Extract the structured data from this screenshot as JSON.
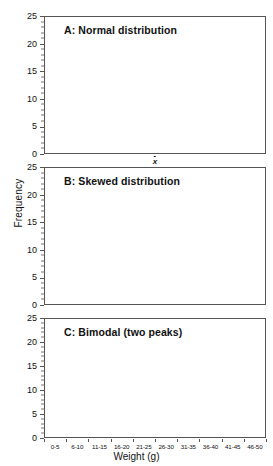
{
  "figure": {
    "xlabel": "Weight (g)",
    "ylabel": "Frequency",
    "bin_labels": [
      "0-5",
      "6-10",
      "11-15",
      "16-20",
      "21-25",
      "26-30",
      "31-35",
      "36-40",
      "41-45",
      "46-50"
    ],
    "y_ticks": [
      0,
      5,
      10,
      15,
      20,
      25
    ],
    "bar_color": "#1a1a1a",
    "curve_color": "#b3b3b3",
    "grid_color": "#d9d9d9",
    "mean_marker_label": "x"
  },
  "chart_data": [
    {
      "type": "bar",
      "panel": "A",
      "title": "A: Normal distribution",
      "categories": [
        "0-5",
        "6-10",
        "11-15",
        "16-20",
        "21-25",
        "26-30",
        "31-35",
        "36-40",
        "41-45",
        "46-50"
      ],
      "values": [
        2,
        3,
        10,
        13,
        19,
        20,
        16,
        12,
        3,
        2
      ],
      "xlabel": "",
      "ylabel": "Frequency",
      "ylim": [
        0,
        25
      ],
      "y_ticks": [
        0,
        5,
        10,
        15,
        20,
        25
      ],
      "grid": true,
      "legend": "none",
      "overlay": {
        "type": "line",
        "name": "normal curve",
        "color": "#b3b3b3",
        "peak_value": 20.5,
        "peak_category_index": 5
      },
      "annotations": [
        {
          "type": "vline",
          "label": "x",
          "style": "dotted",
          "color": "#ffffff",
          "at_category_boundary_index": 5
        }
      ]
    },
    {
      "type": "bar",
      "panel": "B",
      "title": "B: Skewed distribution",
      "categories": [
        "0-5",
        "6-10",
        "11-15",
        "16-20",
        "21-25",
        "26-30",
        "31-35",
        "36-40",
        "41-45",
        "46-50"
      ],
      "values": [
        0,
        0,
        1,
        5,
        10,
        17,
        22,
        12,
        3,
        0
      ],
      "xlabel": "",
      "ylabel": "Frequency",
      "ylim": [
        0,
        25
      ],
      "y_ticks": [
        0,
        5,
        10,
        15,
        20,
        25
      ],
      "grid": true,
      "legend": "none"
    },
    {
      "type": "bar",
      "panel": "C",
      "title": "C: Bimodal (two peaks)",
      "categories": [
        "0-5",
        "6-10",
        "11-15",
        "16-20",
        "21-25",
        "26-30",
        "31-35",
        "36-40",
        "41-45",
        "46-50"
      ],
      "values": [
        0,
        5,
        16,
        4,
        0,
        10,
        14,
        23,
        12,
        0
      ],
      "xlabel": "Weight (g)",
      "ylabel": "Frequency",
      "ylim": [
        0,
        25
      ],
      "y_ticks": [
        0,
        5,
        10,
        15,
        20,
        25
      ],
      "grid": true,
      "legend": "none"
    }
  ]
}
